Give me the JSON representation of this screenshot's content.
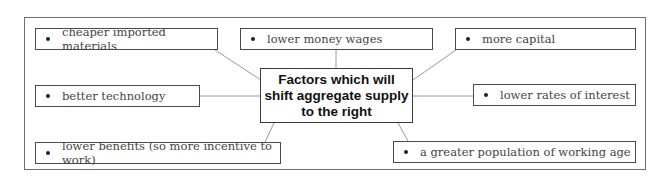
{
  "diagram": {
    "title": "Factors which will shift aggregate supply to the right",
    "title_lines": [
      "Factors which will",
      "shift aggregate supply",
      "to the right"
    ],
    "factors": [
      {
        "label": "cheaper imported materials",
        "position": "top-left"
      },
      {
        "label": "lower money wages",
        "position": "top-center"
      },
      {
        "label": "more capital",
        "position": "top-right"
      },
      {
        "label": "better technology",
        "position": "middle-left"
      },
      {
        "label": "lower rates of interest",
        "position": "middle-right"
      },
      {
        "label": "lower benefits (so more incentive to work)",
        "position": "bottom-left"
      },
      {
        "label": "a greater population of working age",
        "position": "bottom-right"
      }
    ],
    "colors": {
      "border": "#4a4a4a",
      "connector": "#9a9a9a",
      "text": "#444444",
      "title_text": "#111111"
    }
  }
}
